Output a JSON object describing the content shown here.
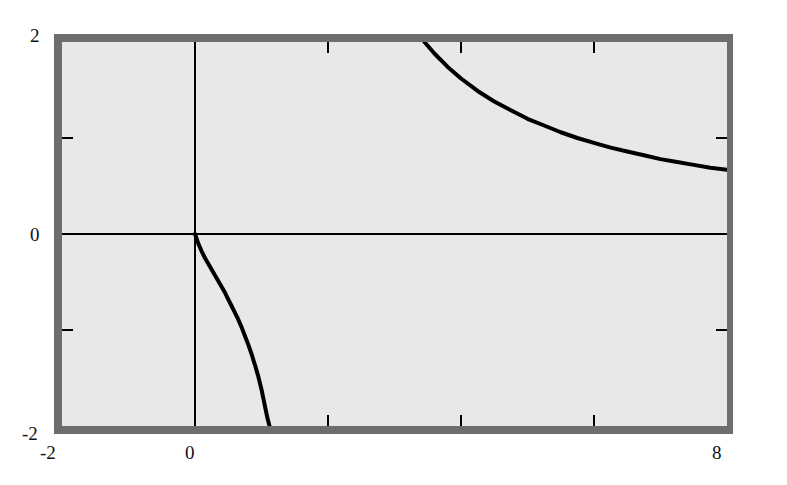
{
  "figure": {
    "kind": "cartesian-graph",
    "background_color": "#ffffff",
    "frame_color": "#6d6d6d",
    "panel_color": "#e8e8e8",
    "curve_color": "#000000",
    "axis_color": "#000000"
  },
  "axes": {
    "x_labels": [
      "-2",
      "0",
      "8"
    ],
    "y_labels": [
      "2",
      "0",
      "-2"
    ],
    "x_tick_values": [
      -2,
      0,
      2,
      4,
      6,
      8
    ],
    "y_tick_values": [
      -2,
      -1,
      0,
      1,
      2
    ],
    "x_axis_label": "",
    "y_axis_label": ""
  },
  "chart_data": {
    "type": "line",
    "title": "",
    "xlabel": "",
    "ylabel": "",
    "xlim": [
      -2,
      8
    ],
    "ylim": [
      -2,
      2
    ],
    "grid": false,
    "legend": "none",
    "x_ticks": [
      -2,
      0,
      2,
      4,
      6,
      8
    ],
    "x_ticklabels": [
      "-2",
      "",
      "",
      "",
      "",
      "8"
    ],
    "x_labeled_ticks": [
      {
        "value": -2,
        "label": "-2"
      },
      {
        "value": 0,
        "label": "0"
      },
      {
        "value": 8,
        "label": "8"
      }
    ],
    "y_ticks": [
      -2,
      -1,
      0,
      1,
      2
    ],
    "y_labeled_ticks": [
      {
        "value": 2,
        "label": "2"
      },
      {
        "value": 0,
        "label": "0"
      },
      {
        "value": -2,
        "label": "-2"
      }
    ],
    "annotations": [
      {
        "text": "vertical asymptote",
        "x": 1.35,
        "y": 0
      },
      {
        "text": "horizontal asymptote",
        "x": 8,
        "y": 0.65
      }
    ],
    "series": [
      {
        "name": "branch-lower-left",
        "description": "Descends from the origin (0, 0) through negative values and falls to minus infinity at the vertical asymptote x = 1.35",
        "points": [
          [
            0.0,
            0.0
          ],
          [
            0.05,
            -0.1
          ],
          [
            0.1,
            -0.18
          ],
          [
            0.15,
            -0.25
          ],
          [
            0.2,
            -0.31
          ],
          [
            0.25,
            -0.37
          ],
          [
            0.3,
            -0.43
          ],
          [
            0.35,
            -0.49
          ],
          [
            0.4,
            -0.55
          ],
          [
            0.45,
            -0.61
          ],
          [
            0.5,
            -0.68
          ],
          [
            0.55,
            -0.75
          ],
          [
            0.6,
            -0.82
          ],
          [
            0.65,
            -0.89
          ],
          [
            0.7,
            -0.97
          ],
          [
            0.75,
            -1.06
          ],
          [
            0.8,
            -1.15
          ],
          [
            0.85,
            -1.25
          ],
          [
            0.9,
            -1.36
          ],
          [
            0.95,
            -1.48
          ],
          [
            1.0,
            -1.62
          ],
          [
            1.03,
            -1.72
          ],
          [
            1.06,
            -1.82
          ],
          [
            1.09,
            -1.92
          ],
          [
            1.12,
            -2.0
          ]
        ]
      },
      {
        "name": "branch-upper-right",
        "description": "Falls from plus infinity just right of the vertical asymptote, crosses the top of the frame at about x = 3.45 and decays toward the horizontal asymptote y = 0.65 at the right edge",
        "points": [
          [
            3.45,
            2.0
          ],
          [
            3.6,
            1.88
          ],
          [
            3.8,
            1.74
          ],
          [
            4.0,
            1.62
          ],
          [
            4.25,
            1.49
          ],
          [
            4.5,
            1.38
          ],
          [
            4.75,
            1.29
          ],
          [
            5.0,
            1.2
          ],
          [
            5.25,
            1.13
          ],
          [
            5.5,
            1.06
          ],
          [
            5.75,
            1.0
          ],
          [
            6.0,
            0.95
          ],
          [
            6.25,
            0.9
          ],
          [
            6.5,
            0.86
          ],
          [
            6.75,
            0.82
          ],
          [
            7.0,
            0.78
          ],
          [
            7.25,
            0.75
          ],
          [
            7.5,
            0.72
          ],
          [
            7.75,
            0.69
          ],
          [
            8.0,
            0.67
          ]
        ]
      }
    ],
    "reference_lines": [
      {
        "name": "x-axis",
        "orientation": "horizontal",
        "value": 0
      },
      {
        "name": "y-axis",
        "orientation": "vertical",
        "value": 0
      }
    ]
  }
}
